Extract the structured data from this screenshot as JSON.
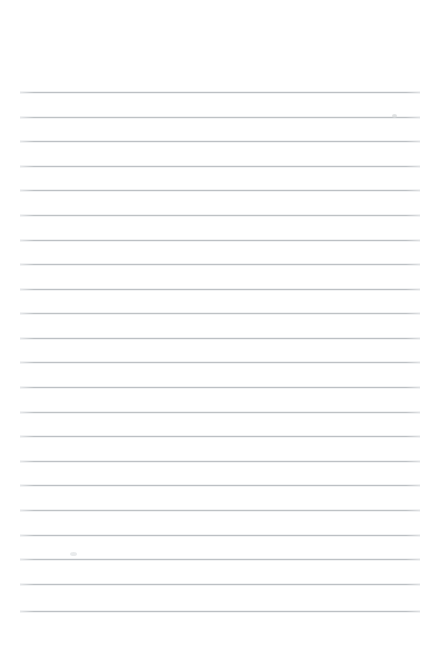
{
  "page": {
    "kind": "ruled-notepad-sheet",
    "title": "",
    "subtitle": "",
    "background_color": "#ffffff",
    "width": 441,
    "height": 645,
    "orientation": "portrait",
    "content_text": "",
    "is_blank": true
  },
  "ruling": {
    "style": "wide-ruled",
    "line_color": "#b9bdc1",
    "line_thickness": 1,
    "line_count": 22,
    "left_margin": 20,
    "right_margin": 21,
    "line_length": 400,
    "first_line_y": 92,
    "last_line_y": 611,
    "line_spacing": 24.7,
    "has_vertical_margin_rule": false,
    "has_holes": false
  },
  "lines": [
    {
      "index": 1,
      "y": 92,
      "x1": 20,
      "x2": 420,
      "opacity": 0.95
    },
    {
      "index": 2,
      "y": 117,
      "x1": 20,
      "x2": 420,
      "opacity": 0.92
    },
    {
      "index": 3,
      "y": 141,
      "x1": 20,
      "x2": 420,
      "opacity": 0.95
    },
    {
      "index": 4,
      "y": 166,
      "x1": 20,
      "x2": 420,
      "opacity": 0.93
    },
    {
      "index": 5,
      "y": 190,
      "x1": 20,
      "x2": 420,
      "opacity": 0.95
    },
    {
      "index": 6,
      "y": 215,
      "x1": 20,
      "x2": 420,
      "opacity": 0.92
    },
    {
      "index": 7,
      "y": 240,
      "x1": 20,
      "x2": 420,
      "opacity": 0.95
    },
    {
      "index": 8,
      "y": 264,
      "x1": 20,
      "x2": 420,
      "opacity": 0.93
    },
    {
      "index": 9,
      "y": 289,
      "x1": 20,
      "x2": 420,
      "opacity": 0.95
    },
    {
      "index": 10,
      "y": 313,
      "x1": 20,
      "x2": 420,
      "opacity": 0.92
    },
    {
      "index": 11,
      "y": 338,
      "x1": 20,
      "x2": 420,
      "opacity": 0.95
    },
    {
      "index": 12,
      "y": 362,
      "x1": 20,
      "x2": 420,
      "opacity": 0.93
    },
    {
      "index": 13,
      "y": 387,
      "x1": 20,
      "x2": 420,
      "opacity": 0.95
    },
    {
      "index": 14,
      "y": 412,
      "x1": 20,
      "x2": 420,
      "opacity": 0.92
    },
    {
      "index": 15,
      "y": 436,
      "x1": 20,
      "x2": 420,
      "opacity": 0.95
    },
    {
      "index": 16,
      "y": 461,
      "x1": 20,
      "x2": 420,
      "opacity": 0.93
    },
    {
      "index": 17,
      "y": 485,
      "x1": 20,
      "x2": 420,
      "opacity": 0.95
    },
    {
      "index": 18,
      "y": 510,
      "x1": 20,
      "x2": 420,
      "opacity": 0.92
    },
    {
      "index": 19,
      "y": 535,
      "x1": 20,
      "x2": 420,
      "opacity": 0.95
    },
    {
      "index": 20,
      "y": 559,
      "x1": 20,
      "x2": 420,
      "opacity": 0.93
    },
    {
      "index": 21,
      "y": 584,
      "x1": 20,
      "x2": 420,
      "opacity": 0.95
    },
    {
      "index": 22,
      "y": 611,
      "x1": 20,
      "x2": 420,
      "opacity": 0.95
    }
  ],
  "marks": [
    {
      "name": "pencil-smudge-upper-right",
      "x": 392,
      "y": 114,
      "w": 5,
      "h": 4,
      "color": "#d7d9db"
    },
    {
      "name": "pencil-smudge-lower-left",
      "x": 70,
      "y": 552,
      "w": 7,
      "h": 4,
      "color": "#e2e4e6"
    }
  ]
}
